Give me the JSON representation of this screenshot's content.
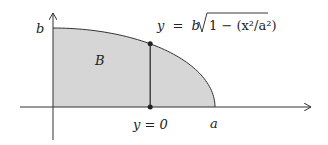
{
  "diagram": {
    "type": "quarter-ellipse-region",
    "region_label": "B",
    "curve_equation": {
      "lhs": "y",
      "eq": "=",
      "coef": "b",
      "radicand": "1 − (x²/a²)"
    },
    "labels": {
      "y_axis_intercept": "b",
      "x_axis_intercept": "a",
      "slice_base": "y = 0"
    },
    "slice_position_fraction_of_a": 0.6,
    "colors": {
      "region_fill": "#d6d6d6",
      "stroke": "#333333",
      "background": "#ffffff"
    }
  }
}
